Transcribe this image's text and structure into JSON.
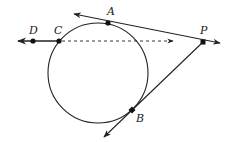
{
  "diagram": {
    "type": "geometry",
    "stroke_color": "#222222",
    "circle": {
      "cx": 98,
      "cy": 73,
      "r": 50
    },
    "points": [
      {
        "id": "A",
        "label": "A",
        "x": 108,
        "y": 23,
        "lx": 107,
        "ly": 15
      },
      {
        "id": "B",
        "label": "B",
        "x": 132,
        "y": 110,
        "lx": 136,
        "ly": 122
      },
      {
        "id": "C",
        "label": "C",
        "x": 59,
        "y": 41,
        "lx": 54,
        "ly": 34
      },
      {
        "id": "D",
        "label": "D",
        "x": 33,
        "y": 41,
        "lx": 29,
        "ly": 34
      },
      {
        "id": "P",
        "label": "P",
        "x": 203,
        "y": 42,
        "lx": 200,
        "ly": 34
      }
    ],
    "lines": [
      {
        "id": "ray-CD",
        "from": "C",
        "to_arrow": [
          18,
          41
        ],
        "style": "solid"
      },
      {
        "id": "dashed-CP",
        "from": [
          59,
          41
        ],
        "to_arrow": [
          173,
          41
        ],
        "style": "dashed"
      },
      {
        "id": "tangent-PA",
        "from_arrow": [
          74,
          14
        ],
        "to_arrow": [
          220,
          43
        ],
        "style": "solid"
      },
      {
        "id": "tangent-PB",
        "from": "P",
        "to_arrow": [
          104,
          137
        ],
        "style": "solid"
      }
    ]
  }
}
